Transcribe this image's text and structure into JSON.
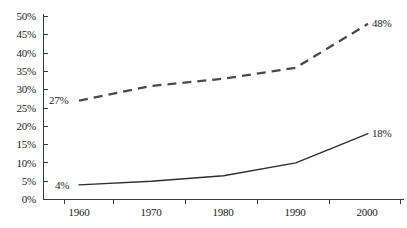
{
  "chart_data": {
    "type": "line",
    "title": "",
    "subtitle": "",
    "xlabel": "",
    "ylabel": "",
    "x": [
      1960,
      1970,
      1980,
      1990,
      2000
    ],
    "categories": [
      "1960",
      "1970",
      "1980",
      "1990",
      "2000"
    ],
    "xlim": [
      1960,
      2000
    ],
    "ylim": [
      0,
      50
    ],
    "y_tick_values": [
      0,
      5,
      10,
      15,
      20,
      25,
      30,
      35,
      40,
      45,
      50
    ],
    "y_tick_labels": [
      "0%",
      "5%",
      "10%",
      "15%",
      "20%",
      "25%",
      "30%",
      "35%",
      "40%",
      "45%",
      "50%"
    ],
    "x_tick_labels": [
      "1960",
      "1970",
      "1980",
      "1990",
      "2000"
    ],
    "grid": false,
    "legend": "none",
    "legend_position": "none",
    "series": [
      {
        "name": "upper-series",
        "style": "dashed",
        "color": "#4a4a4a",
        "values": [
          27,
          31,
          33,
          36,
          48
        ],
        "start_label": "27%",
        "end_label": "48%"
      },
      {
        "name": "lower-series",
        "style": "solid",
        "color": "#2f2f2f",
        "values": [
          4,
          5,
          6.5,
          10,
          18
        ],
        "start_label": "4%",
        "end_label": "18%"
      }
    ],
    "annotations": [
      {
        "text": "27%",
        "series": "upper-series",
        "x": 1960,
        "y": 27,
        "position": "left"
      },
      {
        "text": "48%",
        "series": "upper-series",
        "x": 2000,
        "y": 48,
        "position": "right"
      },
      {
        "text": "4%",
        "series": "lower-series",
        "x": 1960,
        "y": 4,
        "position": "left"
      },
      {
        "text": "18%",
        "series": "lower-series",
        "x": 2000,
        "y": 18,
        "position": "right"
      }
    ]
  },
  "axis": {
    "y_labels": [
      "50%",
      "45%",
      "40%",
      "35%",
      "30%",
      "25%",
      "20%",
      "15%",
      "10%",
      "5%",
      "0%"
    ],
    "x_labels": [
      "1960",
      "1970",
      "1980",
      "1990",
      "2000"
    ]
  },
  "colors": {
    "background": "#ffffff",
    "axis": "#3a3a3a",
    "solid_series": "#2f2f2f",
    "dashed_series": "#4a4a4a",
    "text": "#1c1c1c"
  }
}
